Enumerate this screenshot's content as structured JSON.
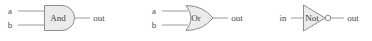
{
  "diagram": {
    "background_color": "#ffffff",
    "body_fill": "#ebebeb",
    "body_stroke": "#8d8d8d",
    "wire_color": "#9a9a9a",
    "label_color": "#4a4a4a"
  },
  "gates": [
    {
      "id": "and",
      "name": "And",
      "shape": "and-gate",
      "inputs": [
        "a",
        "b"
      ],
      "output": "out",
      "has_bubble": false
    },
    {
      "id": "or",
      "name": "Or",
      "shape": "or-gate",
      "inputs": [
        "a",
        "b"
      ],
      "output": "out",
      "has_bubble": false
    },
    {
      "id": "not",
      "name": "Not",
      "shape": "not-gate",
      "inputs": [
        "in"
      ],
      "output": "out",
      "has_bubble": true
    }
  ]
}
